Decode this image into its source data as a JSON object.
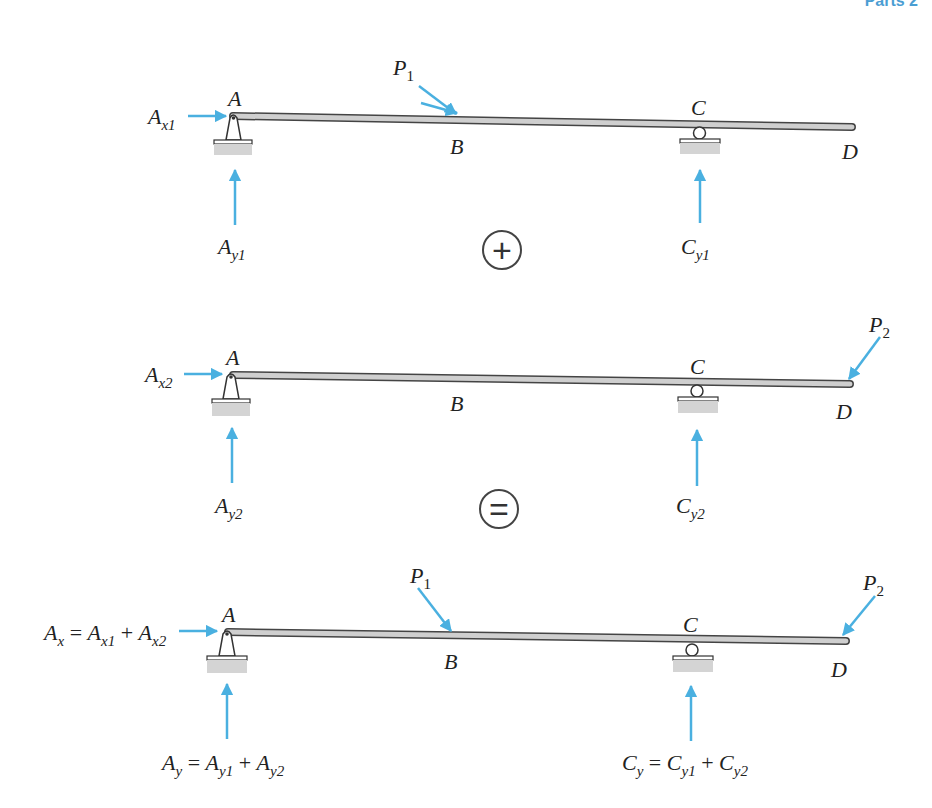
{
  "header": {
    "partial_title": "Parts 2"
  },
  "colors": {
    "force_arrow": "#4ab0e0",
    "beam_fill": "#cfcfcf",
    "beam_stroke": "#444444",
    "ground": "#d4d4d4"
  },
  "diagrams": [
    {
      "id": "case-1",
      "points": {
        "A": "A",
        "B": "B",
        "C": "C",
        "D": "D"
      },
      "forces": {
        "P": {
          "base": "P",
          "sub": "1"
        },
        "Ax": {
          "base": "A",
          "sub": "x1"
        },
        "Ay": {
          "base": "A",
          "sub": "y1"
        },
        "Cy": {
          "base": "C",
          "sub": "y1"
        }
      }
    },
    {
      "id": "case-2",
      "points": {
        "A": "A",
        "B": "B",
        "C": "C",
        "D": "D"
      },
      "forces": {
        "P": {
          "base": "P",
          "sub": "2"
        },
        "Ax": {
          "base": "A",
          "sub": "x2"
        },
        "Ay": {
          "base": "A",
          "sub": "y2"
        },
        "Cy": {
          "base": "C",
          "sub": "y2"
        }
      }
    },
    {
      "id": "superposition",
      "points": {
        "A": "A",
        "B": "B",
        "C": "C",
        "D": "D"
      },
      "forces": {
        "P1": {
          "base": "P",
          "sub": "1"
        },
        "P2": {
          "base": "P",
          "sub": "2"
        },
        "Ax": {
          "lhs_base": "A",
          "lhs_sub": "x",
          "eq": " = ",
          "t1_base": "A",
          "t1_sub": "x1",
          "plus": " + ",
          "t2_base": "A",
          "t2_sub": "x2"
        },
        "Ay": {
          "lhs_base": "A",
          "lhs_sub": "y",
          "eq": " = ",
          "t1_base": "A",
          "t1_sub": "y1",
          "plus": " + ",
          "t2_base": "A",
          "t2_sub": "y2"
        },
        "Cy": {
          "lhs_base": "C",
          "lhs_sub": "y",
          "eq": " = ",
          "t1_base": "C",
          "t1_sub": "y1",
          "plus": " + ",
          "t2_base": "C",
          "t2_sub": "y2"
        }
      }
    }
  ],
  "operators": {
    "plus": "+",
    "equals": "="
  }
}
